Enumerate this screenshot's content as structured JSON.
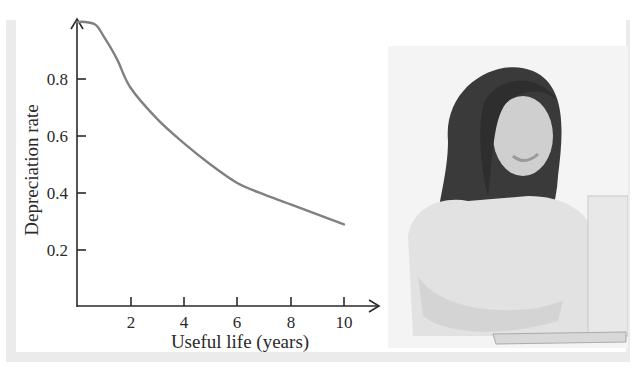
{
  "chart_data": {
    "type": "line",
    "title": "",
    "xlabel": "Useful life (years)",
    "ylabel": "Depreciation rate",
    "x_ticks": [
      2,
      4,
      6,
      8,
      10
    ],
    "y_ticks": [
      0.2,
      0.4,
      0.6,
      0.8
    ],
    "xlim": [
      0,
      11
    ],
    "ylim": [
      0,
      1.0
    ],
    "grid": false,
    "legend": null,
    "series": [
      {
        "name": "Depreciation rate",
        "color": "#808080",
        "x": [
          0,
          0.3,
          0.7,
          1,
          1.5,
          2,
          3,
          4,
          5,
          6,
          7,
          8,
          9,
          10
        ],
        "y": [
          1.0,
          1.0,
          0.99,
          0.95,
          0.87,
          0.77,
          0.66,
          0.575,
          0.5,
          0.435,
          0.395,
          0.36,
          0.325,
          0.29
        ]
      }
    ]
  },
  "figure": {
    "x_tick_labels": [
      "2",
      "4",
      "6",
      "8",
      "10"
    ],
    "y_tick_labels": [
      "0.2",
      "0.4",
      "0.6",
      "0.8"
    ],
    "photo_description": "Smiling woman with long dark hair using a laptop"
  }
}
